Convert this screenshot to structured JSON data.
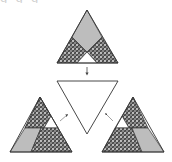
{
  "diagram": {
    "type": "geometric-dissection",
    "top_cut_text": "g g g",
    "colors": {
      "stroke": "#3a3a3a",
      "gray_fill": "#bdbdbd",
      "hatch_dark": "#5a5a5a",
      "hatch_light": "#e6e6e6",
      "white": "#ffffff"
    },
    "nodes": [
      {
        "id": "source-triangle",
        "label": "",
        "orientation": "apex-up",
        "regions": [
          "gray rhombus (top)",
          "hatched (left)",
          "hatched (right)",
          "white triangle (bottom center)"
        ]
      },
      {
        "id": "target-triangle",
        "label": "",
        "orientation": "apex-down",
        "fill": "white"
      },
      {
        "id": "left-variant-triangle",
        "label": "",
        "orientation": "apex-up",
        "regions": [
          "hatched (upper)",
          "white triangle (right middle)",
          "gray parallelogram (bottom left)",
          "hatched (bottom right)"
        ]
      },
      {
        "id": "right-variant-triangle",
        "label": "",
        "orientation": "apex-up",
        "regions": [
          "hatched (upper)",
          "white triangle (left middle)",
          "hatched (bottom left)",
          "gray parallelogram (bottom right)"
        ]
      }
    ],
    "edges": [
      {
        "from": "source-triangle",
        "to": "target-triangle",
        "style": "down-arrow"
      },
      {
        "from": "left-variant-triangle",
        "to": "target-triangle",
        "style": "small-arrow"
      },
      {
        "from": "right-variant-triangle",
        "to": "target-triangle",
        "style": "small-arrow"
      }
    ]
  }
}
